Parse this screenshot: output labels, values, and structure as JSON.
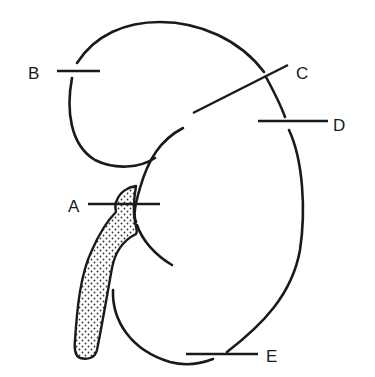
{
  "diagram": {
    "background_color": "#ffffff",
    "stroke_color": "#1a1a1a",
    "labels": [
      {
        "id": "A",
        "text": "A",
        "x": 75,
        "y": 212,
        "leader": {
          "x1": 88,
          "y1": 204,
          "x2": 160,
          "y2": 204
        }
      },
      {
        "id": "B",
        "text": "B",
        "x": 33,
        "y": 79,
        "leader": {
          "x1": 57,
          "y1": 71,
          "x2": 100,
          "y2": 71
        }
      },
      {
        "id": "C",
        "text": "C",
        "x": 302,
        "y": 79,
        "leader": {
          "x1": 193,
          "y1": 113,
          "x2": 288,
          "y2": 65
        }
      },
      {
        "id": "D",
        "text": "D",
        "x": 340,
        "y": 131,
        "leader": {
          "x1": 258,
          "y1": 121,
          "x2": 328,
          "y2": 121
        }
      },
      {
        "id": "E",
        "text": "E",
        "x": 272,
        "y": 362,
        "leader": {
          "x1": 186,
          "y1": 354,
          "x2": 258,
          "y2": 354
        }
      }
    ]
  }
}
